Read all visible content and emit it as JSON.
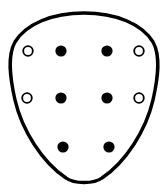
{
  "figure": {
    "title": "Shield-shaped outline diagram with nine hole markers",
    "canvas": {
      "width": 168,
      "height": 193,
      "background": "#ffffff"
    },
    "outline": {
      "name": "shield-outline",
      "shape": "rounded-shield",
      "stroke_color": "#000000",
      "fill_color": "#ffffff",
      "stroke_width": 3.4,
      "path": "M 84 13 C 116 13 142 24 153 42 C 161 56 158 78 153 100 C 146 130 126 162 102 178 C 94 184 74 184 66 178 C 42 162 22 130 15 100 C 10 78 7 56 15 42 C 26 24 52 13 84 13 Z",
      "bounds": {
        "top": 13,
        "bottom": 185,
        "left": 10,
        "right": 158
      }
    },
    "markers": {
      "filled_color": "#000000",
      "open_fill_color": "#ffffff",
      "open_stroke_color": "#000000",
      "open_stroke_width": 1.8,
      "filled_radius": 5.6,
      "open_radius": 4.8,
      "rows": [
        {
          "row_label": "top-row",
          "y": 51,
          "items": [
            {
              "name": "marker-open-top-left",
              "type": "open",
              "cx": 28,
              "cy": 51
            },
            {
              "name": "marker-filled-top-inner-left",
              "type": "filled",
              "cx": 61,
              "cy": 51
            },
            {
              "name": "marker-filled-top-inner-right",
              "type": "filled",
              "cx": 107,
              "cy": 51
            },
            {
              "name": "marker-open-top-right",
              "type": "open",
              "cx": 139,
              "cy": 51
            }
          ]
        },
        {
          "row_label": "middle-row",
          "y": 98,
          "items": [
            {
              "name": "marker-open-middle-left",
              "type": "open",
              "cx": 27,
              "cy": 98
            },
            {
              "name": "marker-filled-middle-inner-left",
              "type": "filled",
              "cx": 61,
              "cy": 98
            },
            {
              "name": "marker-filled-middle-inner-right",
              "type": "filled",
              "cx": 107,
              "cy": 98
            },
            {
              "name": "marker-open-middle-right",
              "type": "open",
              "cx": 139,
              "cy": 98
            }
          ]
        },
        {
          "row_label": "bottom-row",
          "y": 147,
          "items": [
            {
              "name": "marker-filled-bottom-left",
              "type": "filled",
              "cx": 63,
              "cy": 147
            },
            {
              "name": "marker-filled-bottom-right",
              "type": "filled",
              "cx": 109,
              "cy": 147
            }
          ]
        }
      ]
    },
    "counts": {
      "filled_markers": 6,
      "open_markers": 4,
      "total_markers": 10
    }
  }
}
